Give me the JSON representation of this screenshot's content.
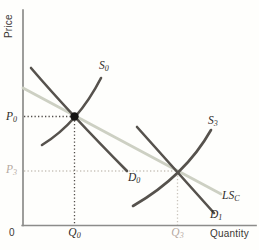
{
  "figure": {
    "type": "supply-demand-diagram",
    "axes": {
      "y_axis_label": "Price",
      "x_axis_label": "Quantity",
      "origin_label": "0"
    },
    "curve_labels": {
      "s0": {
        "main": "S",
        "sub": "0"
      },
      "s3": {
        "main": "S",
        "sub": "3"
      },
      "d0": {
        "main": "D",
        "sub": "0"
      },
      "d1": {
        "main": "D",
        "sub": "1"
      },
      "lsc": {
        "main": "LS",
        "sub": "C"
      }
    },
    "point_labels": {
      "p0": {
        "main": "P",
        "sub": "0"
      },
      "p3": {
        "main": "P",
        "sub": "3"
      },
      "q0": {
        "main": "Q",
        "sub": "0"
      },
      "q3": {
        "main": "Q",
        "sub": "3"
      }
    },
    "colors": {
      "curve_dark": "#56524d",
      "long_run_supply_light": "#cdd0c3",
      "axis": "#8c8c8a",
      "dotted_dark": "#504c48",
      "dotted_light": "#c9c3bb",
      "equilibrium_dot": "#151413",
      "text_dark": "#33302c",
      "text_faded": "#b5a9a1"
    },
    "geometry": {
      "y_axis": "M 23 10 L 23 225.5",
      "x_axis": "M 22.2 225.5 L 256 225.5",
      "lsc": "M 23 88 L 221 194",
      "s0": "M 42 145 Q 78 123 101 78",
      "d0": "M 31 68 Q 70 113.5 127 171",
      "s3": "M 133 206 Q 185 176 211 130",
      "d1": "M 137 127 L 214 213",
      "p0_dotted": "M 24 116.5 L 73 116.5",
      "q0_dotted": "M 74.5 117 L 74.5 225",
      "p3_dotted": "M 24 171 L 176.5 171",
      "q3_dotted": "M 177.5 172 L 177.5 225",
      "equilibrium_dot": "M 70.3 116.5 a 4.2 4.2 0 1 0 8.4 0 a 4.2 4.2 0 1 0 -8.4 0"
    }
  }
}
